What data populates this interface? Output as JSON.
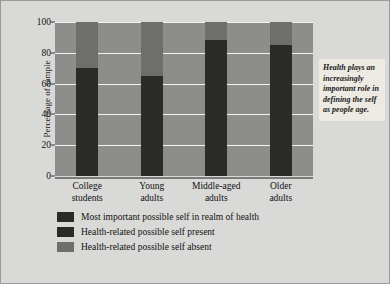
{
  "chart_data": {
    "type": "bar",
    "title": "",
    "subtitle": "",
    "xlabel": "",
    "ylabel": "Percentage of sample",
    "ylim": [
      0,
      100
    ],
    "yticks": [
      0,
      20,
      40,
      60,
      80,
      100
    ],
    "grid": true,
    "stacked": true,
    "legend_position": "bottom-left",
    "categories": [
      "College students",
      "Young adults",
      "Middle-aged adults",
      "Older adults"
    ],
    "series": [
      {
        "name": "Most important possible self in realm of health",
        "color": "#2a2a28",
        "values": [
          null,
          null,
          null,
          null
        ]
      },
      {
        "name": "Health-related possible self present",
        "color": "#2a2a28",
        "values": [
          70,
          65,
          88,
          85
        ]
      },
      {
        "name": "Health-related possible self absent",
        "color": "#6e6e6c",
        "values": [
          30,
          35,
          12,
          15
        ]
      }
    ],
    "annotations": [
      {
        "name": "callout",
        "text": "Health plays an increasingly important role in defining the self as people age."
      }
    ]
  },
  "axes": {
    "y_title": "Percentage of sample",
    "y_tick_labels": [
      "100",
      "80",
      "60",
      "40",
      "20",
      "0"
    ]
  },
  "categories": [
    {
      "line1": "College",
      "line2": "students"
    },
    {
      "line1": "Young",
      "line2": "adults"
    },
    {
      "line1": "Middle-aged",
      "line2": "adults"
    },
    {
      "line1": "Older",
      "line2": "adults"
    }
  ],
  "legend": {
    "items": [
      {
        "label": "Most important possible self in realm of health",
        "color": "#2a2a28"
      },
      {
        "label": "Health-related possible self present",
        "color": "#2a2a28"
      },
      {
        "label": "Health-related possible self absent",
        "color": "#6e6e6c"
      }
    ]
  },
  "callout": {
    "text": "Health plays an increasingly important role in defining the self as people age."
  },
  "colors": {
    "figure_background": "#d9d9d7",
    "plot_background": "#8d8d8b",
    "gridline": "#f2f2f0",
    "dark_segment": "#2a2a28",
    "gray_segment": "#6e6e6c",
    "callout_background": "#eceae3"
  }
}
